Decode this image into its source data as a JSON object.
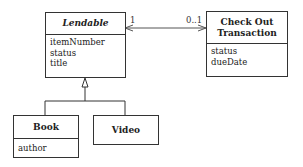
{
  "classes": {
    "lendable": {
      "name": "Lendable",
      "abstract": true,
      "attributes": [
        "itemNumber",
        "status",
        "title"
      ]
    },
    "checkout": {
      "name_line1": "Check Out",
      "name_line2": "Transaction",
      "attributes": [
        "status",
        "dueDate"
      ]
    },
    "book": {
      "name": "Book",
      "attributes": [
        "author"
      ]
    },
    "video": {
      "name": "Video",
      "attributes": []
    }
  },
  "associations": [
    {
      "from": "Lendable",
      "to": "Check Out Transaction",
      "from_multiplicity": "1",
      "to_multiplicity": "0..1",
      "navigability": "bidirectional"
    }
  ],
  "generalizations": [
    {
      "parent": "Lendable",
      "children": [
        "Book",
        "Video"
      ]
    }
  ],
  "colors": {
    "line": "#333333",
    "background": "#ffffff"
  }
}
